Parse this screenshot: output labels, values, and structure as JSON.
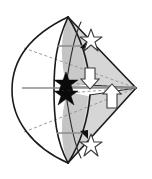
{
  "figure": {
    "background_color": "#ffffff",
    "width": 152,
    "height": 179,
    "colors": {
      "outline": "#1a1a1a",
      "shade_fill": "#c9c9c9",
      "shade_fill_light": "#d9d9d9",
      "dashed_line": "#9a9a9a",
      "axis_line": "#8c8c8c",
      "star_filled": "#0a0a0a",
      "star_hollow_stroke": "#3d3d3d",
      "arrow_fill": "#ffffff",
      "arrow_stroke": "#3a3a3a"
    },
    "geometry": {
      "apex_top": [
        68,
        17
      ],
      "apex_bottom": [
        68,
        163
      ],
      "right_vertex": [
        136,
        88
      ],
      "left_arc_extreme": [
        12,
        90
      ],
      "center_axis_y": 88
    },
    "elements": [
      {
        "name": "outer-lens-arc",
        "type": "arc",
        "role": "white lens body left side"
      },
      {
        "name": "shaded-petal-upper",
        "type": "region",
        "role": "gray caustic upper lobe"
      },
      {
        "name": "shaded-petal-lower",
        "type": "region",
        "role": "gray caustic lower lobe"
      },
      {
        "name": "cone-edge-upper",
        "type": "line",
        "from": [
          68,
          17
        ],
        "to": [
          136,
          88
        ]
      },
      {
        "name": "cone-edge-lower",
        "type": "line",
        "from": [
          68,
          163
        ],
        "to": [
          136,
          88
        ]
      },
      {
        "name": "dashed-ray-upper",
        "type": "dashed-line",
        "from": [
          24,
          48
        ],
        "to": [
          136,
          88
        ]
      },
      {
        "name": "dashed-ray-lower",
        "type": "dashed-line",
        "from": [
          24,
          132
        ],
        "to": [
          136,
          88
        ]
      },
      {
        "name": "dashed-ray-mid-upper",
        "type": "dashed-line",
        "from": [
          66,
          84
        ],
        "to": [
          136,
          88
        ]
      },
      {
        "name": "dashed-ray-mid-lower",
        "type": "dashed-line",
        "from": [
          66,
          92
        ],
        "to": [
          136,
          88
        ]
      },
      {
        "name": "axis-line-main",
        "type": "axis",
        "from": [
          22,
          88
        ],
        "to": [
          136,
          88
        ]
      },
      {
        "name": "axis-line-upper-tick",
        "type": "axis",
        "from": [
          56,
          46
        ],
        "to": [
          90,
          46
        ]
      },
      {
        "name": "axis-line-lower-tick",
        "type": "axis",
        "from": [
          56,
          133
        ],
        "to": [
          90,
          133
        ]
      },
      {
        "name": "star-filled-upper",
        "type": "star",
        "at": [
          66,
          82
        ],
        "style": "filled"
      },
      {
        "name": "star-filled-lower",
        "type": "star",
        "at": [
          66,
          92
        ],
        "style": "filled"
      },
      {
        "name": "star-hollow-upper",
        "type": "star",
        "at": [
          91,
          38
        ],
        "style": "hollow"
      },
      {
        "name": "star-hollow-lower",
        "type": "star",
        "at": [
          91,
          143
        ],
        "style": "hollow"
      },
      {
        "name": "arrow-down-block",
        "type": "block-arrow",
        "at": [
          90,
          80
        ],
        "direction": "down"
      },
      {
        "name": "arrow-up-block",
        "type": "block-arrow",
        "at": [
          112,
          96
        ],
        "direction": "up"
      },
      {
        "name": "tip-arrow-upper",
        "type": "arrowhead",
        "at": [
          83,
          44
        ],
        "direction": "up-right"
      },
      {
        "name": "tip-arrow-lower",
        "type": "arrowhead",
        "at": [
          83,
          134
        ],
        "direction": "down-right"
      }
    ]
  }
}
